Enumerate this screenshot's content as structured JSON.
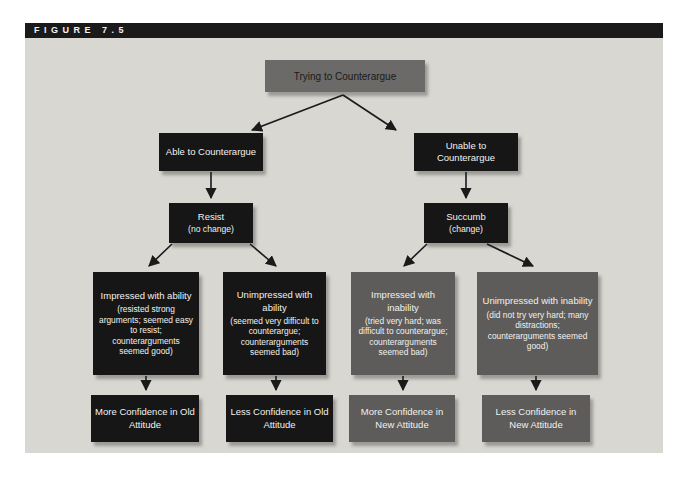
{
  "figure": {
    "label": "FIGURE 7.5"
  },
  "colors": {
    "panel_bg": "#d9d7d2",
    "header_bar_bg": "#1a1a1a",
    "header_text": "#f5f4f0",
    "black_box_bg": "#161616",
    "gray_box_bg": "#5d5c5a",
    "root_box_bg": "#6b6a68",
    "box_text_light": "#f2f1ee",
    "arrow": "#1a1a1a"
  },
  "flowchart": {
    "root": {
      "text": "Trying to Counterargue"
    },
    "branches": [
      {
        "condition": "Able to Counterargue",
        "outcome_title": "Resist",
        "outcome_note": "(no change)"
      },
      {
        "condition": "Unable to Counterargue",
        "outcome_title": "Succumb",
        "outcome_note": "(change)"
      }
    ],
    "appraisals": [
      {
        "title": "Impressed with ability",
        "detail": "(resisted strong arguments; seemed easy to resist; counterarguments seemed good)"
      },
      {
        "title": "Unimpressed with ability",
        "detail": "(seemed very difficult to counterargue; counterarguments seemed bad)"
      },
      {
        "title": "Impressed with inability",
        "detail": "(tried very hard; was difficult to counterargue; counterarguments seemed bad)"
      },
      {
        "title": "Unimpressed with inability",
        "detail": "(did not try very hard; many distractions; counterarguments seemed good)"
      }
    ],
    "results": [
      {
        "text": "More Confidence in Old Attitude"
      },
      {
        "text": "Less Confidence in Old Attitude"
      },
      {
        "text": "More Confidence in New Attitude"
      },
      {
        "text": "Less Confidence in New Attitude"
      }
    ]
  }
}
